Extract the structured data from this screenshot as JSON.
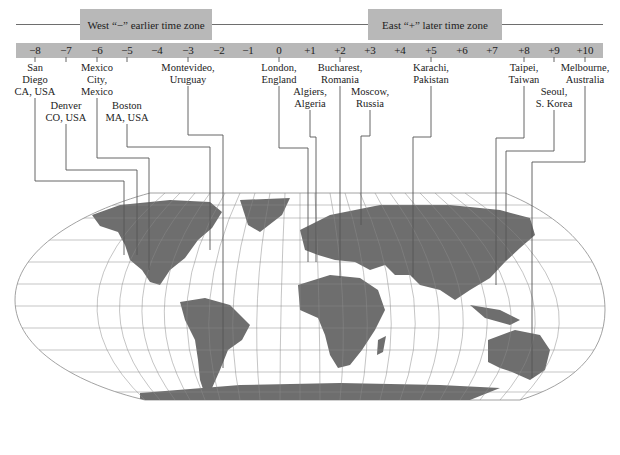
{
  "header": {
    "west_label": "West “−” earlier time zone",
    "east_label": "East “+” later time zone"
  },
  "colors": {
    "band": "#b8b8b8",
    "land": "#6e6e6e",
    "grid": "#8a8a8a",
    "leader": "#555555",
    "text": "#222222"
  },
  "zones": [
    {
      "label": "−8",
      "x": 35
    },
    {
      "label": "−7",
      "x": 66
    },
    {
      "label": "−6",
      "x": 97
    },
    {
      "label": "−5",
      "x": 127
    },
    {
      "label": "−4",
      "x": 157
    },
    {
      "label": "−3",
      "x": 188
    },
    {
      "label": "−2",
      "x": 219
    },
    {
      "label": "−1",
      "x": 248
    },
    {
      "label": "0",
      "x": 279
    },
    {
      "label": "+1",
      "x": 310
    },
    {
      "label": "+2",
      "x": 340
    },
    {
      "label": "+3",
      "x": 370
    },
    {
      "label": "+4",
      "x": 400
    },
    {
      "label": "+5",
      "x": 431
    },
    {
      "label": "+6",
      "x": 462
    },
    {
      "label": "+7",
      "x": 492
    },
    {
      "label": "+8",
      "x": 524
    },
    {
      "label": "+9",
      "x": 554
    },
    {
      "label": "+10",
      "x": 585
    }
  ],
  "cities": [
    {
      "name": "San\nDiego\nCA, USA",
      "x": 35,
      "y": 62
    },
    {
      "name": "Denver\nCO, USA",
      "x": 66,
      "y": 100
    },
    {
      "name": "Mexico\nCity,\nMexico",
      "x": 97,
      "y": 62
    },
    {
      "name": "Boston\nMA, USA",
      "x": 127,
      "y": 100
    },
    {
      "name": "Montevideo,\nUruguay",
      "x": 188,
      "y": 62
    },
    {
      "name": "London,\nEngland",
      "x": 279,
      "y": 62
    },
    {
      "name": "Algiers,\nAlgeria",
      "x": 310,
      "y": 86
    },
    {
      "name": "Bucharest,\nRomania",
      "x": 340,
      "y": 62
    },
    {
      "name": "Moscow,\nRussia",
      "x": 370,
      "y": 86
    },
    {
      "name": "Karachi,\nPakistan",
      "x": 431,
      "y": 62
    },
    {
      "name": "Taipei,\nTaiwan",
      "x": 524,
      "y": 62
    },
    {
      "name": "Seoul,\nS. Korea",
      "x": 554,
      "y": 86
    },
    {
      "name": "Melbourne,\nAustralia",
      "x": 585,
      "y": 62
    }
  ]
}
